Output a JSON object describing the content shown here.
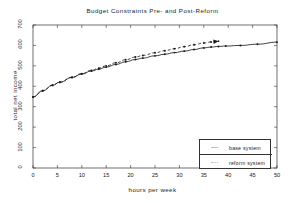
{
  "chart_data": {
    "type": "line",
    "title": "Budget Constraints Pre- and Post-Reform",
    "xlabel": "hours per week",
    "ylabel": "total net income",
    "xlim": [
      0,
      50
    ],
    "ylim": [
      0,
      700
    ],
    "xticks": [
      0,
      5,
      10,
      15,
      20,
      25,
      30,
      35,
      40,
      45,
      50
    ],
    "yticks": [
      0,
      100,
      200,
      300,
      400,
      500,
      600,
      700
    ],
    "grid": false,
    "legend_position": "lower right",
    "background": "#ffffff",
    "foreground": "#1a1a1a",
    "series": [
      {
        "name": "base system",
        "style": "solid",
        "color": "#1a1a1a",
        "marker": "dot",
        "x": [
          0,
          2,
          4,
          5.5,
          8,
          10,
          12,
          13.5,
          15,
          17,
          19,
          21,
          22.5,
          25,
          27,
          29,
          31,
          33,
          35,
          36.5,
          38,
          39.5,
          42.5,
          46,
          50
        ],
        "y": [
          348,
          378,
          405,
          420,
          443,
          460,
          475,
          484,
          494,
          507,
          520,
          531,
          538,
          549,
          557,
          565,
          572,
          580,
          588,
          592,
          595,
          597,
          600,
          606,
          616
        ]
      },
      {
        "name": "reform system",
        "style": "dashed",
        "color": "#1a1a1a",
        "marker": "dot",
        "arrow_end": true,
        "x": [
          0,
          2,
          4,
          5.5,
          8,
          10,
          12,
          13.5,
          15,
          17,
          19,
          21,
          22.5,
          25,
          27,
          29,
          31,
          33,
          35,
          36.5,
          38
        ],
        "y": [
          348,
          378,
          405,
          420,
          444,
          462,
          478,
          489,
          500,
          515,
          530,
          543,
          551,
          564,
          574,
          584,
          594,
          603,
          612,
          617,
          621
        ]
      }
    ]
  }
}
